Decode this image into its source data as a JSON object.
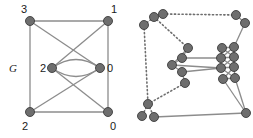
{
  "figure": {
    "name": "two-graph-figure",
    "background": "#ffffff",
    "width": 253,
    "height": 138,
    "node_color": "#6e6e6e",
    "node_stroke": "#3c3c3c",
    "edge_color": "#8c8c8c",
    "dotted_edge_color": "#6e6e6e",
    "label_color": "#1a1a1a"
  },
  "left_graph": {
    "label": "G",
    "node_labels": {
      "top_left": "3",
      "top_right": "1",
      "mid_left": "2",
      "mid_right": "0",
      "bottom_left": "2",
      "bottom_right": "0"
    },
    "nodes": [
      {
        "id": "tl",
        "label": "3",
        "x": 30,
        "y": 21,
        "r": 4.5
      },
      {
        "id": "tr",
        "label": "1",
        "x": 108,
        "y": 21,
        "r": 4.5
      },
      {
        "id": "ml",
        "label": "2",
        "x": 52,
        "y": 68,
        "r": 4.5
      },
      {
        "id": "mr",
        "label": "0",
        "x": 100,
        "y": 68,
        "r": 4.5
      },
      {
        "id": "bl",
        "label": "2",
        "x": 30,
        "y": 112,
        "r": 4.5
      },
      {
        "id": "br",
        "label": "0",
        "x": 108,
        "y": 112,
        "r": 4.5
      }
    ],
    "edges": [
      {
        "from": "tl",
        "to": "tr",
        "style": "solid"
      },
      {
        "from": "tl",
        "to": "bl",
        "style": "solid"
      },
      {
        "from": "tr",
        "to": "br",
        "style": "solid"
      },
      {
        "from": "bl",
        "to": "br",
        "style": "solid"
      },
      {
        "from": "tl",
        "to": "mr",
        "style": "solid"
      },
      {
        "from": "tr",
        "to": "ml",
        "style": "solid"
      },
      {
        "from": "bl",
        "to": "mr",
        "style": "solid"
      },
      {
        "from": "br",
        "to": "ml",
        "style": "solid"
      },
      {
        "from": "ml",
        "to": "mr",
        "style": "curve-up"
      },
      {
        "from": "ml",
        "to": "mr",
        "style": "curve-down"
      }
    ]
  },
  "right_graph": {
    "label": "",
    "description": "expanded-graph",
    "nodes": [
      {
        "id": "a1",
        "x": 18,
        "y": 25,
        "r": 4.5
      },
      {
        "id": "a2",
        "x": 28,
        "y": 17,
        "r": 4.5
      },
      {
        "id": "a3",
        "x": 37,
        "y": 14,
        "r": 4.5
      },
      {
        "id": "b1",
        "x": 110,
        "y": 15,
        "r": 4.5
      },
      {
        "id": "b2",
        "x": 119,
        "y": 23,
        "r": 4.5
      },
      {
        "id": "c1",
        "x": 62,
        "y": 48,
        "r": 4.5
      },
      {
        "id": "c2",
        "x": 56,
        "y": 58,
        "r": 4.5
      },
      {
        "id": "c3",
        "x": 46,
        "y": 65,
        "r": 4.5
      },
      {
        "id": "c4",
        "x": 56,
        "y": 72,
        "r": 4.5
      },
      {
        "id": "c5",
        "x": 59,
        "y": 83,
        "r": 4.5
      },
      {
        "id": "d1",
        "x": 96,
        "y": 48,
        "r": 4.5
      },
      {
        "id": "d2",
        "x": 108,
        "y": 47,
        "r": 4.5
      },
      {
        "id": "d3",
        "x": 95,
        "y": 58,
        "r": 4.5
      },
      {
        "id": "d4",
        "x": 108,
        "y": 57,
        "r": 4.5
      },
      {
        "id": "d5",
        "x": 95,
        "y": 68,
        "r": 4.5
      },
      {
        "id": "d6",
        "x": 108,
        "y": 67,
        "r": 4.5
      },
      {
        "id": "d7",
        "x": 97,
        "y": 79,
        "r": 4.5
      },
      {
        "id": "d8",
        "x": 109,
        "y": 78,
        "r": 4.5
      },
      {
        "id": "e1",
        "x": 22,
        "y": 104,
        "r": 4.5
      },
      {
        "id": "e2",
        "x": 16,
        "y": 116,
        "r": 4.5
      },
      {
        "id": "e3",
        "x": 28,
        "y": 117,
        "r": 4.5
      },
      {
        "id": "f1",
        "x": 120,
        "y": 113,
        "r": 4.5
      }
    ],
    "edges": [
      {
        "from": "a3",
        "to": "b1",
        "style": "dotted"
      },
      {
        "from": "a2",
        "to": "a3",
        "style": "dotted"
      },
      {
        "from": "a1",
        "to": "a2",
        "style": "dotted"
      },
      {
        "from": "a1",
        "to": "e1",
        "style": "dotted"
      },
      {
        "from": "a2",
        "to": "c1",
        "style": "dotted"
      },
      {
        "from": "c5",
        "to": "e1",
        "style": "dotted"
      },
      {
        "from": "e1",
        "to": "e2",
        "style": "dotted"
      },
      {
        "from": "e1",
        "to": "e3",
        "style": "dotted"
      },
      {
        "from": "c1",
        "to": "c2",
        "style": "solid"
      },
      {
        "from": "c2",
        "to": "c3",
        "style": "solid"
      },
      {
        "from": "c3",
        "to": "c4",
        "style": "solid"
      },
      {
        "from": "c4",
        "to": "c5",
        "style": "solid"
      },
      {
        "from": "c3",
        "to": "c1",
        "style": "solid"
      },
      {
        "from": "c2",
        "to": "d3",
        "style": "solid"
      },
      {
        "from": "c4",
        "to": "d5",
        "style": "solid"
      },
      {
        "from": "c3",
        "to": "d5",
        "style": "solid"
      },
      {
        "from": "b2",
        "to": "d2",
        "style": "solid"
      },
      {
        "from": "b1",
        "to": "b2",
        "style": "solid"
      },
      {
        "from": "e3",
        "to": "f1",
        "style": "solid"
      },
      {
        "from": "d1",
        "to": "d2",
        "style": "solid"
      },
      {
        "from": "d1",
        "to": "d4",
        "style": "solid"
      },
      {
        "from": "d2",
        "to": "d3",
        "style": "solid"
      },
      {
        "from": "d3",
        "to": "d4",
        "style": "solid"
      },
      {
        "from": "d3",
        "to": "d6",
        "style": "solid"
      },
      {
        "from": "d4",
        "to": "d5",
        "style": "solid"
      },
      {
        "from": "d5",
        "to": "d6",
        "style": "solid"
      },
      {
        "from": "d5",
        "to": "d8",
        "style": "solid"
      },
      {
        "from": "d6",
        "to": "d7",
        "style": "solid"
      },
      {
        "from": "d7",
        "to": "d8",
        "style": "solid"
      },
      {
        "from": "d1",
        "to": "d3",
        "style": "solid"
      },
      {
        "from": "d2",
        "to": "d4",
        "style": "solid"
      },
      {
        "from": "d4",
        "to": "d6",
        "style": "solid"
      },
      {
        "from": "d6",
        "to": "d8",
        "style": "solid"
      },
      {
        "from": "d7",
        "to": "f1",
        "style": "solid"
      },
      {
        "from": "d8",
        "to": "f1",
        "style": "solid"
      }
    ]
  }
}
